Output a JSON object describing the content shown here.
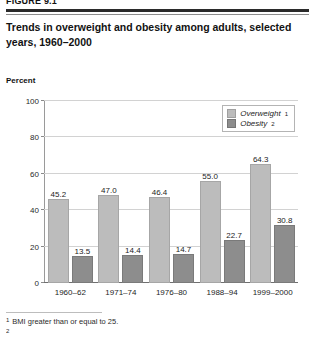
{
  "figure": {
    "number": "FIGURE 9.1",
    "title": "Trends in overweight and obesity among adults, selected years, 1960–2000"
  },
  "chart_data": {
    "type": "bar",
    "title": "Trends in overweight and obesity among adults, selected years, 1960–2000",
    "xlabel": "",
    "ylabel": "Percent",
    "ylim": [
      0,
      100
    ],
    "yticks": [
      "0",
      "20",
      "40",
      "60",
      "80",
      "100"
    ],
    "grid": true,
    "legend_position": "top-right",
    "categories": [
      "1960–62",
      "1971–74",
      "1976–80",
      "1988–94",
      "1999–2000"
    ],
    "series": [
      {
        "name": "Overweight",
        "footnote_mark": "1",
        "color": "#bcbcbc",
        "values": [
          45.2,
          47.0,
          46.4,
          55.0,
          64.3
        ],
        "labels": [
          "45.2",
          "47.0",
          "46.4",
          "55.0",
          "64.3"
        ]
      },
      {
        "name": "Obesity",
        "footnote_mark": "2",
        "color": "#8d8d8d",
        "values": [
          13.5,
          14.4,
          14.7,
          22.7,
          30.8
        ],
        "labels": [
          "13.5",
          "14.4",
          "14.7",
          "22.7",
          "30.8"
        ]
      }
    ]
  },
  "footnotes": [
    {
      "mark": "1",
      "text": "BMI greater than or equal to 25."
    }
  ]
}
